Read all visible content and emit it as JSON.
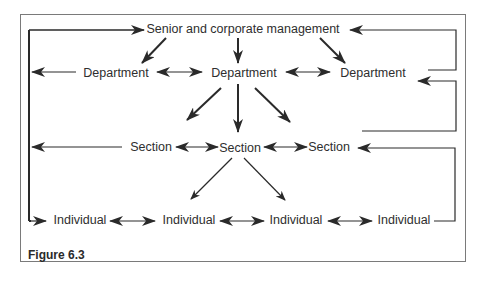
{
  "figure": {
    "caption": "Figure 6.3",
    "type": "organisational communication flow diagram"
  },
  "nodes": {
    "top": {
      "label": "Senior and corporate management"
    },
    "departments": [
      {
        "label": "Department"
      },
      {
        "label": "Department"
      },
      {
        "label": "Department"
      }
    ],
    "sections": [
      {
        "label": "Section"
      },
      {
        "label": "Section"
      },
      {
        "label": "Section"
      }
    ],
    "individuals": [
      {
        "label": "Individual"
      },
      {
        "label": "Individual"
      },
      {
        "label": "Individual"
      },
      {
        "label": "Individual"
      }
    ]
  },
  "edges": [
    {
      "from": "Senior and corporate management",
      "to": "Department (left)",
      "type": "one-way"
    },
    {
      "from": "Senior and corporate management",
      "to": "Department (centre)",
      "type": "one-way"
    },
    {
      "from": "Senior and corporate management",
      "to": "Department (right)",
      "type": "one-way"
    },
    {
      "from": "Department (left)",
      "to": "Department (centre)",
      "type": "two-way"
    },
    {
      "from": "Department (centre)",
      "to": "Department (right)",
      "type": "two-way"
    },
    {
      "from": "Department (centre)",
      "to": "Section (left)",
      "type": "one-way"
    },
    {
      "from": "Department (centre)",
      "to": "Section (centre)",
      "type": "one-way"
    },
    {
      "from": "Department (centre)",
      "to": "Section (right)",
      "type": "one-way"
    },
    {
      "from": "Section (left)",
      "to": "Section (centre)",
      "type": "two-way"
    },
    {
      "from": "Section (centre)",
      "to": "Section (right)",
      "type": "two-way"
    },
    {
      "from": "Section (centre)",
      "to": "Individual (2)",
      "type": "one-way"
    },
    {
      "from": "Section (centre)",
      "to": "Individual (3)",
      "type": "one-way"
    },
    {
      "from": "Individual (1)",
      "to": "Individual (2)",
      "type": "two-way"
    },
    {
      "from": "Individual (2)",
      "to": "Individual (3)",
      "type": "two-way"
    },
    {
      "from": "Individual (3)",
      "to": "Individual (4)",
      "type": "two-way"
    },
    {
      "from": "Left feedback line",
      "to": "Senior and corporate management",
      "type": "feedback-up"
    },
    {
      "from": "Left feedback line",
      "to": "Department (left)",
      "type": "feedback"
    },
    {
      "from": "Left feedback line",
      "to": "Section (left)",
      "type": "feedback"
    },
    {
      "from": "Left feedback line",
      "to": "Individual (1)",
      "type": "feedback"
    },
    {
      "from": "Department (right)",
      "to": "Senior and corporate management",
      "type": "feedback-up"
    },
    {
      "from": "Section (right)",
      "to": "Department (right)",
      "type": "feedback-up"
    },
    {
      "from": "Individual (4)",
      "to": "Section (right)",
      "type": "feedback-up"
    }
  ]
}
